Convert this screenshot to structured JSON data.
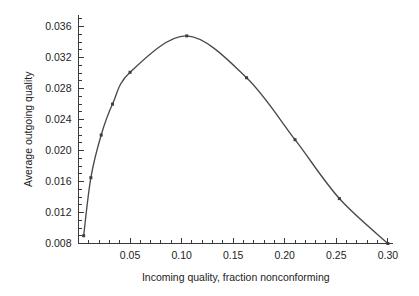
{
  "chart_data": {
    "type": "line",
    "title": "",
    "xlabel": "Incoming quality, fraction nonconforming",
    "ylabel": "Average outgoing quality",
    "xlim": [
      0.0,
      0.305
    ],
    "ylim": [
      0.008,
      0.0375
    ],
    "grid": false,
    "legend": "none",
    "marker": "square",
    "line_color": "#4a4a4a",
    "marker_color": "#3d3d3d",
    "x_major_ticks": [
      0.05,
      0.1,
      0.15,
      0.2,
      0.25,
      0.3
    ],
    "x_major_tick_labels": [
      "0.05",
      "0.10",
      "0.15",
      "0.20",
      "0.25",
      "0.30"
    ],
    "x_minor_tick_step": 0.01,
    "y_major_ticks": [
      0.008,
      0.012,
      0.016,
      0.02,
      0.024,
      0.028,
      0.032,
      0.036
    ],
    "y_major_tick_labels": [
      "0.008",
      "0.012",
      "0.016",
      "0.020",
      "0.024",
      "0.028",
      "0.032",
      "0.036"
    ],
    "y_minor_tick_step": 0.001,
    "x": [
      0.005,
      0.012,
      0.022,
      0.033,
      0.05,
      0.105,
      0.163,
      0.21,
      0.253,
      0.3
    ],
    "values": [
      0.009,
      0.0165,
      0.022,
      0.026,
      0.0301,
      0.0348,
      0.0294,
      0.0214,
      0.0138,
      0.008
    ],
    "series": [
      {
        "name": "Average outgoing quality",
        "points": [
          {
            "x": 0.005,
            "y": 0.009
          },
          {
            "x": 0.012,
            "y": 0.0165
          },
          {
            "x": 0.022,
            "y": 0.022
          },
          {
            "x": 0.033,
            "y": 0.026
          },
          {
            "x": 0.05,
            "y": 0.0301
          },
          {
            "x": 0.105,
            "y": 0.0348
          },
          {
            "x": 0.163,
            "y": 0.0294
          },
          {
            "x": 0.21,
            "y": 0.0214
          },
          {
            "x": 0.253,
            "y": 0.0138
          },
          {
            "x": 0.3,
            "y": 0.008
          }
        ]
      }
    ],
    "peak": {
      "x": 0.105,
      "y": 0.0348
    }
  }
}
